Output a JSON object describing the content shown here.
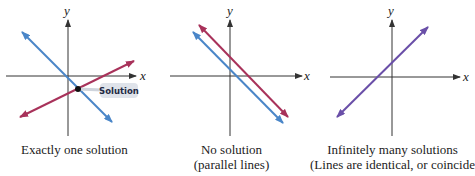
{
  "colors": {
    "line_blue": "#4a86c8",
    "line_red": "#a8325a",
    "line_purple": "#6a4fa8",
    "axis": "#333333",
    "label_box": "#dfe3ea"
  },
  "panels": [
    {
      "id": "one-solution",
      "x_label": "x",
      "y_label": "y",
      "annotation": "Solution",
      "caption_lines": [
        "Exactly one solution"
      ]
    },
    {
      "id": "no-solution",
      "x_label": "x",
      "y_label": "y",
      "caption_lines": [
        "No solution",
        "(parallel lines)"
      ]
    },
    {
      "id": "infinitely-many",
      "x_label": "x",
      "y_label": "y",
      "caption_lines": [
        "Infinitely many solutions",
        "(Lines are identical, or coincide.)"
      ]
    }
  ]
}
